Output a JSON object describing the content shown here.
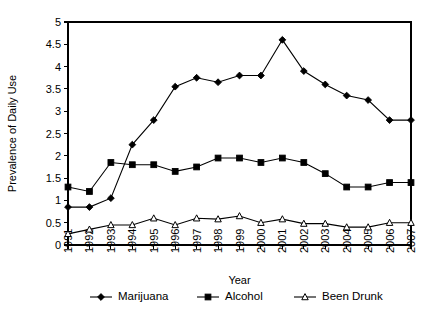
{
  "chart_data": {
    "type": "line",
    "title": "",
    "xlabel": "Year",
    "ylabel": "Prevalence of Daily Use",
    "xlim": [
      1991,
      2007
    ],
    "ylim": [
      0,
      5
    ],
    "ytick_values": [
      0,
      0.5,
      1,
      1.5,
      2,
      2.5,
      3,
      3.5,
      4,
      4.5,
      5
    ],
    "ytick_labels": [
      "0",
      "0.5",
      "1",
      "1.5",
      "2",
      "2.5",
      "3",
      "3.5",
      "4",
      "4.5",
      "5"
    ],
    "grid": false,
    "legend_position": "bottom",
    "x_tick_rotation": 90,
    "categories": [
      1991,
      1992,
      1993,
      1994,
      1995,
      1996,
      1997,
      1998,
      1999,
      2000,
      2001,
      2002,
      2003,
      2004,
      2005,
      2006,
      2007
    ],
    "xtick_labels": [
      "1991",
      "1992",
      "1993",
      "1994",
      "1995",
      "1996",
      "1997",
      "1998",
      "1999",
      "2000",
      "2001",
      "2002",
      "2003",
      "2004",
      "2005",
      "2006",
      "2007"
    ],
    "series": [
      {
        "name": "Marijuana",
        "marker": "filled-diamond",
        "color": "#000000",
        "values": [
          0.85,
          0.85,
          1.05,
          2.25,
          2.8,
          3.55,
          3.75,
          3.65,
          3.8,
          3.8,
          4.6,
          3.9,
          3.6,
          3.35,
          3.25,
          2.8,
          2.8
        ]
      },
      {
        "name": "Alcohol",
        "marker": "filled-square",
        "color": "#000000",
        "values": [
          1.3,
          1.2,
          1.85,
          1.8,
          1.8,
          1.65,
          1.75,
          1.95,
          1.95,
          1.85,
          1.95,
          1.85,
          1.6,
          1.3,
          1.3,
          1.4,
          1.4
        ]
      },
      {
        "name": "Been Drunk",
        "marker": "open-triangle",
        "color": "#000000",
        "values": [
          0.25,
          0.35,
          0.45,
          0.45,
          0.6,
          0.45,
          0.6,
          0.58,
          0.65,
          0.5,
          0.58,
          0.48,
          0.48,
          0.4,
          0.4,
          0.5,
          0.5
        ]
      }
    ],
    "legend": [
      {
        "label": "Marijuana",
        "marker": "filled-diamond"
      },
      {
        "label": "Alcohol",
        "marker": "filled-square"
      },
      {
        "label": "Been Drunk",
        "marker": "open-triangle"
      }
    ]
  }
}
